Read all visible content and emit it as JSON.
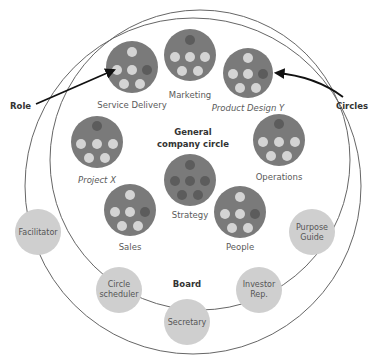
{
  "diagram": {
    "title_lines": [
      "General",
      "company circle"
    ],
    "board_label": "Board",
    "annotations": {
      "role": "Role",
      "circles": "Circles"
    },
    "colors": {
      "circle_fill": "#7a7a7a",
      "member_light": "#d4d4d4",
      "member_dark": "#5c5c5c",
      "board_role_fill": "#cfcfcf",
      "outline": "#666666",
      "arrow": "#111111"
    },
    "circles": [
      {
        "name": "Service Delivery",
        "italic": false
      },
      {
        "name": "Marketing",
        "italic": false
      },
      {
        "name": "Product Design Y",
        "italic": true
      },
      {
        "name": "Project X",
        "italic": true
      },
      {
        "name": "Operations",
        "italic": false
      },
      {
        "name": "Strategy",
        "italic": false
      },
      {
        "name": "Sales",
        "italic": false
      },
      {
        "name": "People",
        "italic": false
      }
    ],
    "board_roles": [
      {
        "lines": [
          "Facilitator"
        ]
      },
      {
        "lines": [
          "Purpose",
          "Guide"
        ]
      },
      {
        "lines": [
          "Circle",
          "scheduler"
        ]
      },
      {
        "lines": [
          "Investor",
          "Rep."
        ]
      },
      {
        "lines": [
          "Secretary"
        ]
      }
    ]
  }
}
